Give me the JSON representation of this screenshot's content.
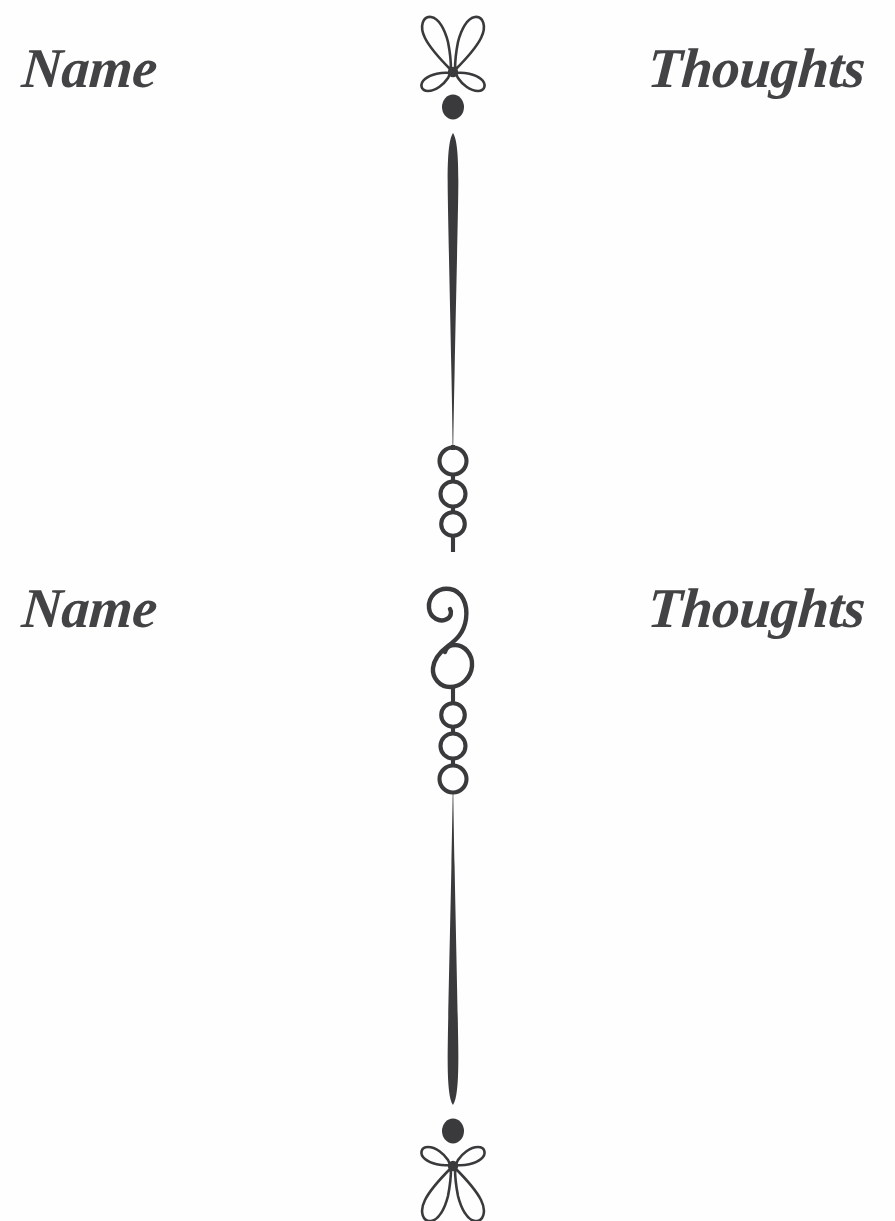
{
  "page": {
    "width": 895,
    "height": 1221,
    "background_color": "#ffffff",
    "ink_color": "#3a3a3c",
    "medium": "scanned-album-page"
  },
  "rows": [
    {
      "left_label": "Name",
      "right_label": "Thoughts",
      "top": 40
    },
    {
      "left_label": "Name",
      "right_label": "Thoughts",
      "top": 580
    }
  ],
  "divider": {
    "center_x": 453,
    "elements": [
      {
        "name": "fleuron-butterfly-top",
        "y": 70,
        "rotation": 0
      },
      {
        "name": "solid-dot-top",
        "y": 105,
        "radius": 11
      },
      {
        "name": "tapered-rule-upper",
        "y_start": 128,
        "y_end": 448
      },
      {
        "name": "circle-chain-upper",
        "y_start": 448,
        "y_end": 548,
        "count": 3
      },
      {
        "name": "s-scroll-swash",
        "y_start": 578,
        "y_end": 688
      },
      {
        "name": "circle-chain-lower",
        "y_start": 698,
        "y_end": 808,
        "count": 3
      },
      {
        "name": "tapered-rule-lower",
        "y_start": 808,
        "y_end": 1108
      },
      {
        "name": "solid-dot-bottom",
        "y": 1130,
        "radius": 11
      },
      {
        "name": "fleuron-butterfly-bottom",
        "y": 1170,
        "rotation": 180
      }
    ],
    "circle_chain_upper_radii": [
      13.5,
      12.5,
      11.5
    ],
    "circle_chain_lower_radii": [
      11.5,
      12.5,
      13.5
    ]
  }
}
